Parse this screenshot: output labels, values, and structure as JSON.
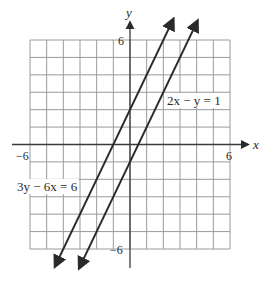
{
  "chart_data": {
    "type": "line",
    "title": "",
    "xlabel": "x",
    "ylabel": "y",
    "xlim": [
      -6,
      6
    ],
    "ylim": [
      -6,
      6
    ],
    "grid": true,
    "grid_step": 1,
    "tick_labels": {
      "x_min": "−6",
      "x_max": "6",
      "y_min": "−6",
      "y_max": "6"
    },
    "series": [
      {
        "name": "3y − 6x = 6",
        "equation": "3y − 6x = 6",
        "slope_intercept": "y = 2x + 2",
        "slope": 2,
        "intercept": 2,
        "x": [
          -4.5,
          2.6
        ],
        "y": [
          -7.0,
          7.2
        ]
      },
      {
        "name": "2x − y = 1",
        "equation": "2x − y = 1",
        "slope_intercept": "y = 2x − 1",
        "slope": 2,
        "intercept": -1,
        "x": [
          -3.05,
          4.05
        ],
        "y": [
          -7.1,
          7.1
        ]
      }
    ],
    "annotations": [
      {
        "text": "2x − y = 1",
        "near_series": 1
      },
      {
        "text": "3y − 6x = 6",
        "near_series": 0
      }
    ],
    "line_color": "#2a2a2a",
    "grid_color": "#9a9a9a"
  }
}
